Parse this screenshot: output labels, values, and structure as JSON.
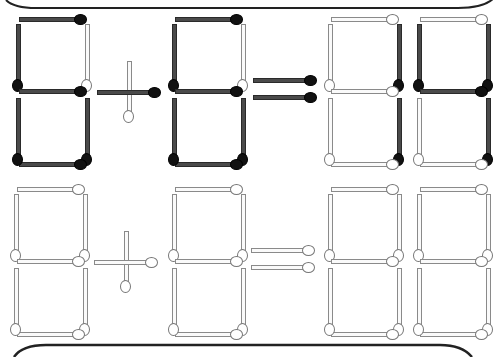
{
  "puzzle": {
    "title": "Matchstick equation puzzle",
    "colors": {
      "dark_match": "#4a4a4a",
      "dark_head": "#111111",
      "light_match": "#fafafa",
      "light_outline": "#8a8a8a"
    },
    "rows": [
      {
        "name": "problem",
        "equation": "6 - 6 = 14",
        "symbols": [
          {
            "type": "digit",
            "value": "6",
            "x": 12,
            "lit": {
              "a": true,
              "b": false,
              "c": true,
              "d": true,
              "e": true,
              "f": true,
              "g": true
            }
          },
          {
            "type": "operator",
            "value": "-",
            "x": 97,
            "lit": {
              "h": true,
              "v": false
            }
          },
          {
            "type": "digit",
            "value": "6",
            "x": 168,
            "lit": {
              "a": true,
              "b": false,
              "c": true,
              "d": true,
              "e": true,
              "f": true,
              "g": true
            }
          },
          {
            "type": "equals",
            "value": "=",
            "x": 253,
            "lit": {
              "top": true,
              "bottom": true
            }
          },
          {
            "type": "digit",
            "value": "1",
            "x": 324,
            "lit": {
              "a": false,
              "b": true,
              "c": true,
              "d": false,
              "e": false,
              "f": false,
              "g": false
            }
          },
          {
            "type": "digit",
            "value": "4",
            "x": 413,
            "lit": {
              "a": false,
              "b": true,
              "c": true,
              "d": false,
              "e": false,
              "f": true,
              "g": true
            }
          }
        ],
        "y": 14
      },
      {
        "name": "answer-template",
        "equation": "",
        "symbols": [
          {
            "type": "digit",
            "value": "",
            "x": 10,
            "lit": {
              "a": false,
              "b": false,
              "c": false,
              "d": false,
              "e": false,
              "f": false,
              "g": false
            }
          },
          {
            "type": "operator",
            "value": "+",
            "x": 94,
            "lit": {
              "h": false,
              "v": false
            }
          },
          {
            "type": "digit",
            "value": "",
            "x": 168,
            "lit": {
              "a": false,
              "b": false,
              "c": false,
              "d": false,
              "e": false,
              "f": false,
              "g": false
            }
          },
          {
            "type": "equals",
            "value": "=",
            "x": 251,
            "lit": {
              "top": false,
              "bottom": false
            }
          },
          {
            "type": "digit",
            "value": "",
            "x": 324,
            "lit": {
              "a": false,
              "b": false,
              "c": false,
              "d": false,
              "e": false,
              "f": false,
              "g": false
            }
          },
          {
            "type": "digit",
            "value": "",
            "x": 413,
            "lit": {
              "a": false,
              "b": false,
              "c": false,
              "d": false,
              "e": false,
              "f": false,
              "g": false
            }
          }
        ],
        "y": 184
      }
    ]
  }
}
